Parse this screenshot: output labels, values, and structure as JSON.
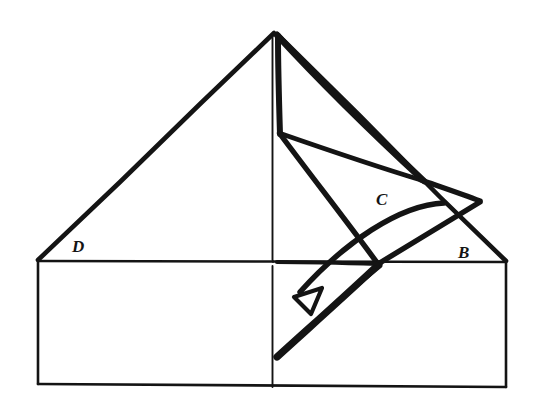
{
  "figure": {
    "background_color": "#ffffff",
    "ink_color": "#141414",
    "canvas": {
      "width": 541,
      "height": 417
    }
  },
  "labels": {
    "d": "D",
    "b": "B",
    "c": "C"
  },
  "label_positions": {
    "d": {
      "x": 72,
      "y": 252
    },
    "b": {
      "x": 458,
      "y": 258
    },
    "c": {
      "x": 376,
      "y": 205
    }
  },
  "geometry": {
    "apex": {
      "x": 274,
      "y": 32
    },
    "box_top_left": {
      "x": 38,
      "y": 261
    },
    "box_top_right": {
      "x": 506,
      "y": 262
    },
    "box_bottom_left": {
      "x": 38,
      "y": 384
    },
    "box_bottom_right": {
      "x": 506,
      "y": 387
    },
    "center_line_x": 273,
    "fold_vertex": {
      "x": 278,
      "y": 132
    },
    "flap_tip": {
      "x": 478,
      "y": 200
    },
    "flap_mid": {
      "x": 419,
      "y": 178
    },
    "crossing_point": {
      "x": 375,
      "y": 262
    },
    "lower_flap_bottom": {
      "x": 277,
      "y": 356
    },
    "arrow_tail": {
      "x": 443,
      "y": 203
    },
    "arrow_head": {
      "x": 296,
      "y": 296
    }
  },
  "strokes": {
    "thin_width": 2,
    "medium_width": 4,
    "thick_width": 7,
    "arrow_width": 5
  },
  "paths": {
    "pyramid_left_edge": "M 274 33 L 38 261",
    "pyramid_right_edge": "M 276 34 L 506 262",
    "box_outline": "M 38 261 L 506 262 L 506 387 L 38 384 Z",
    "box_top_edge": "M 38 261 L 506 262",
    "center_vertical_upper": "M 273 34 L 273 261",
    "center_vertical_lower": "M 273 266 L 273 387",
    "flap_long_fold": "M 276 35 L 424 180",
    "flap_inner_fold": "M 277 36 L 279 134",
    "flap_base_left": "M 278 133 L 420 179",
    "flap_spine": "M 279 134 L 377 263",
    "flap_to_tip": "M 421 179 L 479 201",
    "flap_tip_down": "M 479 201 L 378 263",
    "lower_flap_left": "M 377 263 L 277 356",
    "lower_flap_right": "M 277 356 L 379 265",
    "arc_arrow": "M 443 203 C 400 206 345 245 296 296"
  },
  "arrow": {
    "head_points": "296,296 320,291 311,312",
    "head_style": "open-triangle"
  }
}
